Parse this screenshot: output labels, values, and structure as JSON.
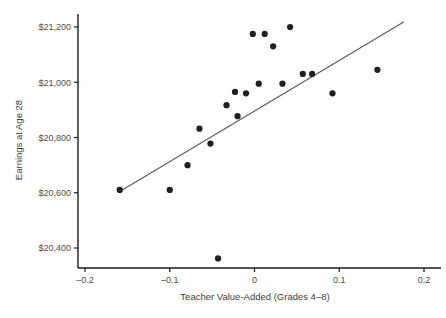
{
  "chart_data": {
    "type": "scatter",
    "title": "",
    "xlabel": "Teacher Value-Added (Grades 4–8)",
    "ylabel": "Earnings at Age 28",
    "xlim": [
      -0.2,
      0.2
    ],
    "ylim": [
      20400,
      21200
    ],
    "xticks": [
      -0.2,
      -0.1,
      0,
      0.1,
      0.2
    ],
    "xticklabels": [
      "–0.2",
      "–0.1",
      "0",
      "0.1",
      "0.2"
    ],
    "yticks": [
      20400,
      20600,
      20800,
      21000,
      21200
    ],
    "yticklabels": [
      "$20,400",
      "$20,600",
      "$20,800",
      "$21,000",
      "$21,200"
    ],
    "grid": false,
    "legend": null,
    "marker_color": "#231f20",
    "marker_size": 5,
    "series": [
      {
        "name": "Earnings vs Teacher Value-Added",
        "points": [
          {
            "x": -0.159,
            "y": 20610
          },
          {
            "x": -0.1,
            "y": 20610
          },
          {
            "x": -0.079,
            "y": 20700
          },
          {
            "x": -0.065,
            "y": 20832
          },
          {
            "x": -0.052,
            "y": 20778
          },
          {
            "x": -0.043,
            "y": 20362
          },
          {
            "x": -0.033,
            "y": 20917
          },
          {
            "x": -0.023,
            "y": 20965
          },
          {
            "x": -0.02,
            "y": 20877
          },
          {
            "x": -0.01,
            "y": 20960
          },
          {
            "x": -0.002,
            "y": 21175
          },
          {
            "x": 0.005,
            "y": 20995
          },
          {
            "x": 0.012,
            "y": 21175
          },
          {
            "x": 0.022,
            "y": 21130
          },
          {
            "x": 0.033,
            "y": 20995
          },
          {
            "x": 0.042,
            "y": 21200
          },
          {
            "x": 0.057,
            "y": 21030
          },
          {
            "x": 0.068,
            "y": 21030
          },
          {
            "x": 0.092,
            "y": 20960
          },
          {
            "x": 0.145,
            "y": 21045
          }
        ]
      }
    ],
    "trendline": {
      "name": "fitted-regression-line",
      "color": "#5a5a5a",
      "x_start": -0.16,
      "y_start": 20603,
      "x_end": 0.176,
      "y_end": 21218
    }
  }
}
